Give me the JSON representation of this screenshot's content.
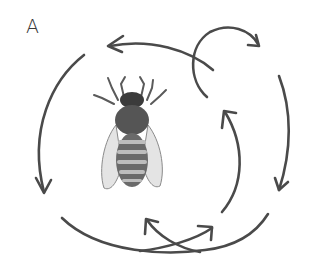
{
  "figure": {
    "panel_label": "A"
  },
  "colors": {
    "stroke": "#4a4a4a",
    "bee_dark": "#3b3b3b",
    "bee_mid": "#7a7a7a",
    "bee_light": "#c9c9c9",
    "background": "#ffffff"
  }
}
